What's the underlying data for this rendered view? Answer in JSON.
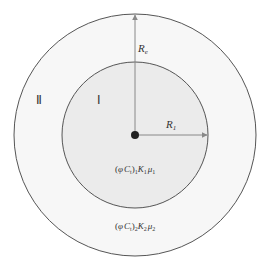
{
  "diagram": {
    "regions": [
      {
        "id": "outer",
        "label": "Ⅱ",
        "properties": "(φC_t)₂K₂μ₂",
        "fill": "#f7f7f7",
        "stroke": "#555555"
      },
      {
        "id": "inner",
        "label": "Ⅰ",
        "properties": "(φC_t)₁K₁μ₁",
        "fill": "#ebebeb",
        "stroke": "#555555"
      }
    ],
    "radii": {
      "outer_label": "R",
      "outer_sub": "e",
      "inner_label": "R",
      "inner_sub": "1"
    },
    "inner_props": {
      "open": "(",
      "phi": "φ",
      "C": "C",
      "Csub": "t",
      "close": ")",
      "sub": "1",
      "K": "K",
      "Ksub": "1",
      "mu": "μ",
      "musub": "1"
    },
    "outer_props": {
      "open": "(",
      "phi": "φ",
      "C": "C",
      "Csub": "t",
      "close": ")",
      "sub": "2",
      "K": "K",
      "Ksub": "2",
      "mu": "μ",
      "musub": "2"
    },
    "arrow_color": "#888888",
    "center_dot_color": "#222222"
  }
}
